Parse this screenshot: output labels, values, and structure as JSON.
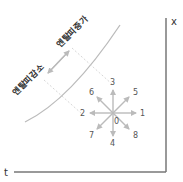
{
  "diagram": {
    "axes": {
      "x_label": "x",
      "t_label": "t"
    },
    "curve_labels": {
      "increase": "엔탈피증가",
      "decrease": "엔탈피감소"
    },
    "directions": [
      {
        "id": "0",
        "label": "0"
      },
      {
        "id": "1",
        "label": "1"
      },
      {
        "id": "2",
        "label": "2"
      },
      {
        "id": "3",
        "label": "3"
      },
      {
        "id": "4",
        "label": "4"
      },
      {
        "id": "5",
        "label": "5"
      },
      {
        "id": "6",
        "label": "6"
      },
      {
        "id": "7",
        "label": "7"
      },
      {
        "id": "8",
        "label": "8"
      }
    ],
    "colors": {
      "axis": "#777777",
      "arrow": "#bbbbbb",
      "curve": "#bbbbbb",
      "dash": "#cccccc"
    }
  }
}
